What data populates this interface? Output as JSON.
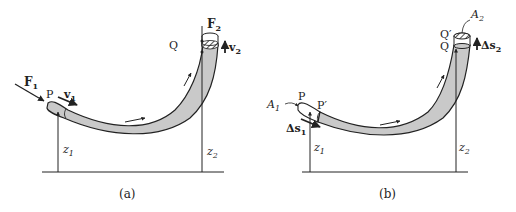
{
  "figure": {
    "panels": [
      {
        "id": "a",
        "caption": "(a)",
        "labels": {
          "force_in": "F",
          "force_in_sub": "1",
          "force_out": "F",
          "force_out_sub": "2",
          "point_in": "P",
          "point_out": "Q",
          "vel_in": "v",
          "vel_in_sub": "1",
          "vel_out": "v",
          "vel_out_sub": "2",
          "height_in": "z",
          "height_in_sub": "1",
          "height_out": "z",
          "height_out_sub": "2"
        }
      },
      {
        "id": "b",
        "caption": "(b)",
        "labels": {
          "area_in": "A",
          "area_in_sub": "1",
          "area_out": "A",
          "area_out_sub": "2",
          "point_in": "P",
          "point_in_prime": "P′",
          "point_out": "Q",
          "point_out_prime": "Q′",
          "disp_in": "Δs",
          "disp_in_sub": "1",
          "disp_out": "Δs",
          "disp_out_sub": "2",
          "height_in": "z",
          "height_in_sub": "1",
          "height_out": "z",
          "height_out_sub": "2"
        }
      }
    ],
    "colors": {
      "pipe_fill": "#c9c9c9",
      "stroke": "#222222",
      "background": "#ffffff"
    }
  }
}
